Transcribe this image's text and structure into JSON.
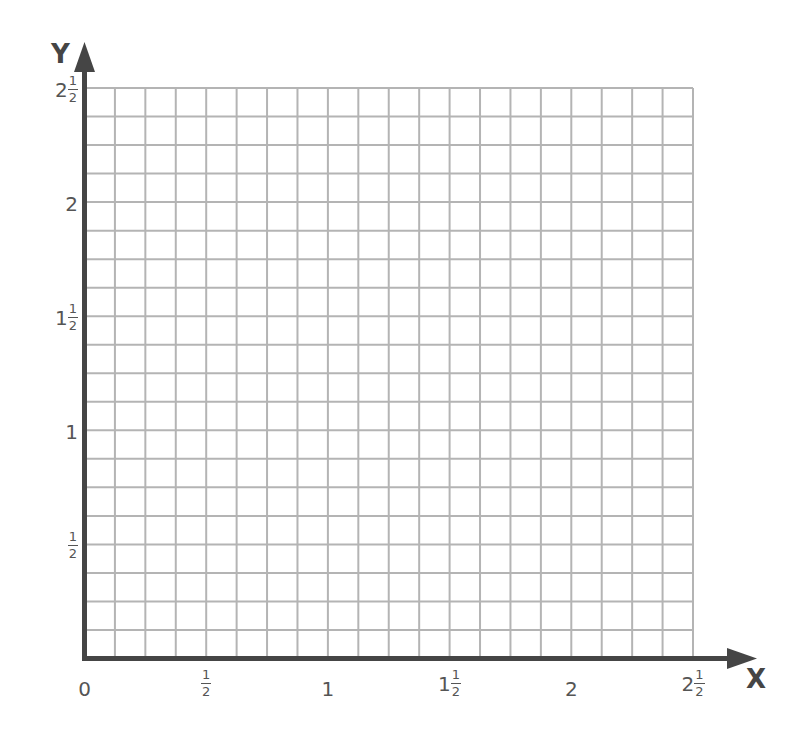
{
  "diagram": {
    "type": "coordinate-grid",
    "x_axis": {
      "name": "X",
      "min": 0,
      "max": 2.5,
      "ticks": [
        {
          "whole": "0",
          "num": "",
          "den": ""
        },
        {
          "whole": "",
          "num": "1",
          "den": "2"
        },
        {
          "whole": "1",
          "num": "",
          "den": ""
        },
        {
          "whole": "1",
          "num": "1",
          "den": "2"
        },
        {
          "whole": "2",
          "num": "",
          "den": ""
        },
        {
          "whole": "2",
          "num": "1",
          "den": "2"
        }
      ]
    },
    "y_axis": {
      "name": "Y",
      "min": 0,
      "max": 2.5,
      "ticks": [
        {
          "whole": "",
          "num": "1",
          "den": "2"
        },
        {
          "whole": "1",
          "num": "",
          "den": ""
        },
        {
          "whole": "1",
          "num": "1",
          "den": "2"
        },
        {
          "whole": "2",
          "num": "",
          "den": ""
        },
        {
          "whole": "2",
          "num": "1",
          "den": "2"
        }
      ]
    },
    "grid": {
      "columns": 20,
      "rows": 20,
      "cells_per_half_unit": 4
    },
    "colors": {
      "axis": "#454545",
      "grid": "#b4b4b4",
      "label": "#555555",
      "background": "#ffffff"
    }
  }
}
